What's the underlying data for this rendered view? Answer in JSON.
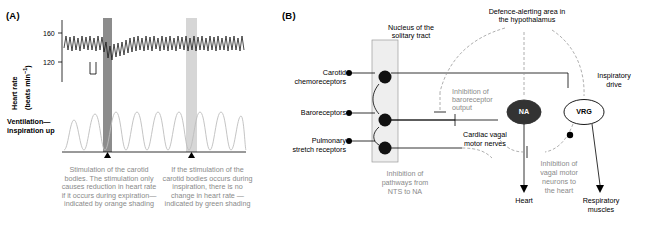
{
  "panels": {
    "a_label": "(A)",
    "b_label": "(B)"
  },
  "panel_a": {
    "y_axis_line1": "Heart rate",
    "y_axis_line2": "(beats min",
    "y_axis_sup": "−1",
    "y_axis_close": ")",
    "ticks": [
      "160",
      "120"
    ],
    "lower_axis_line1": "Ventilation—",
    "lower_axis_line2": "inspiration up",
    "caption_left": "Stimulation of the carotid bodies. The stimulation only causes reduction in heart rate if it occurs during expiration—indicated by orange shading",
    "caption_right": "If the stimulation of the carotid bodies occurs during inspiration, there is no change in heart rate —indicated by green shading",
    "marker_symbol": "▲"
  },
  "panel_b": {
    "nts_label_line1": "Nucleus of the",
    "nts_label_line2": "solitary tract",
    "hypothalamus_line1": "Defence-alerting area in",
    "hypothalamus_line2": "the hypothalamus",
    "carotid_line1": "Carotid",
    "carotid_line2": "chemoreceptors",
    "baroreceptors": "Baroreceptors",
    "pulmonary_line1": "Pulmonary",
    "pulmonary_line2": "stretch receptors",
    "inhibition_baro_line1": "Inhibition of",
    "inhibition_baro_line2": "baroreceptor",
    "inhibition_baro_line3": "output",
    "na_label": "NA",
    "vrg_label": "VRG",
    "inspiratory_line1": "Inspiratory",
    "inspiratory_line2": "drive",
    "cardiac_vagal_line1": "Cardiac vagal",
    "cardiac_vagal_line2": "motor nerves",
    "inhibition_nts_line1": "Inhibition of",
    "inhibition_nts_line2": "pathways from",
    "inhibition_nts_line3": "NTS to NA",
    "inhibition_vagal_line1": "Inhibition of",
    "inhibition_vagal_line2": "vagal motor",
    "inhibition_vagal_line3": "neurons to",
    "inhibition_vagal_line4": "the heart",
    "heart": "Heart",
    "respiratory_line1": "Respiratory",
    "respiratory_line2": "muscles"
  },
  "colors": {
    "gray_text": "#8a8a8a",
    "na_fill": "#333333",
    "nts_fill": "#eeeeee",
    "orange_shade": "#8c8c8c",
    "green_shade": "#d6d6d6"
  }
}
